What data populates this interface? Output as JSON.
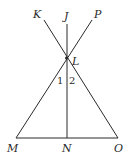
{
  "diagram": {
    "points": {
      "K": {
        "label": "K",
        "x": 44,
        "y": 20,
        "lx": 33,
        "ly": 18
      },
      "J": {
        "label": "J",
        "x": 67,
        "y": 24,
        "lx": 64,
        "ly": 20
      },
      "P": {
        "label": "P",
        "x": 92,
        "y": 20,
        "lx": 94,
        "ly": 18
      },
      "L": {
        "label": "L",
        "x": 66,
        "y": 58,
        "lx": 72,
        "ly": 65
      },
      "M": {
        "label": "M",
        "x": 16,
        "y": 138,
        "lx": 7,
        "ly": 152
      },
      "N": {
        "label": "N",
        "x": 67,
        "y": 138,
        "lx": 62,
        "ly": 152
      },
      "O": {
        "label": "O",
        "x": 118,
        "y": 138,
        "lx": 114,
        "ly": 152
      }
    },
    "angle_labels": [
      {
        "label": "1",
        "x": 57,
        "y": 84
      },
      {
        "label": "2",
        "x": 69,
        "y": 84
      }
    ],
    "stroke_color": "#2a2a2a"
  }
}
